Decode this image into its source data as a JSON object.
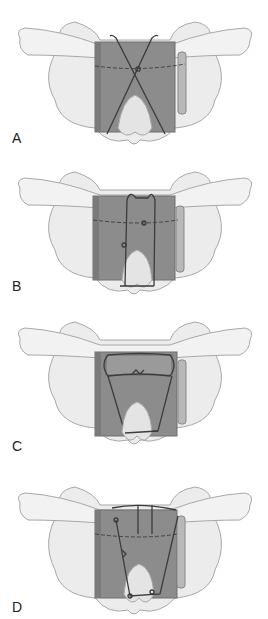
{
  "figure": {
    "panels": [
      {
        "label": "A",
        "top": 0,
        "technique": "crossed-wire"
      },
      {
        "label": "B",
        "top": 150,
        "technique": "vertical-loop-wire"
      },
      {
        "label": "C",
        "top": 300,
        "technique": "loop-and-twist-wire"
      },
      {
        "label": "D",
        "top": 450,
        "technique": "multi-strand-wire"
      }
    ]
  },
  "colors": {
    "background": "#ffffff",
    "bone_fill": "#ececec",
    "bone_shade": "#d4d4d4",
    "bone_outline": "#a8a8a8",
    "graft_fill": "#8c8c8c",
    "graft_edge": "#6e6e6e",
    "graft_side": "#b8b8b8",
    "wire": "#3c3c3c"
  }
}
